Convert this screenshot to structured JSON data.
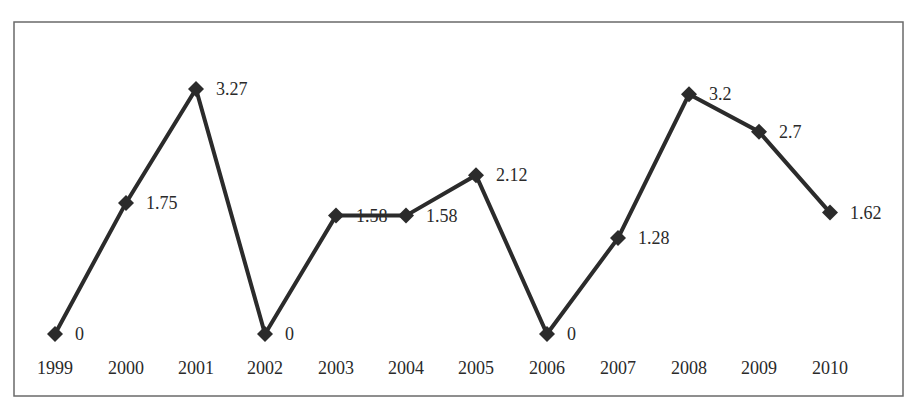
{
  "chart_data": {
    "type": "line",
    "title": "",
    "xlabel": "",
    "ylabel": "",
    "categories": [
      "1999",
      "2000",
      "2001",
      "2002",
      "2003",
      "2004",
      "2005",
      "2006",
      "2007",
      "2008",
      "2009",
      "2010"
    ],
    "series": [
      {
        "name": "",
        "values": [
          0,
          1.75,
          3.27,
          0,
          1.58,
          1.58,
          2.12,
          0,
          1.28,
          3.2,
          2.7,
          1.62
        ],
        "labels": [
          "0",
          "1.75",
          "3.27",
          "0",
          "1.58",
          "1.58",
          "2.12",
          "0",
          "1.28",
          "3.2",
          "2.7",
          "1.62"
        ],
        "color": "#2b2b2b",
        "marker": "diamond"
      }
    ],
    "ylim": [
      0,
      3.27
    ],
    "grid": false,
    "legend": "none",
    "y_axis_visible": false,
    "border": true
  },
  "layout": {
    "frame": {
      "x": 14,
      "y": 22,
      "w": 889,
      "h": 374
    },
    "x_positions": [
      55,
      126,
      196,
      265,
      336,
      406,
      476,
      547,
      618,
      689,
      759,
      830
    ],
    "y_zero": 334,
    "y_top_value_px": 89,
    "label_y": 374,
    "line_color": "#2b2b2b",
    "frame_color": "#6a6a6a"
  }
}
